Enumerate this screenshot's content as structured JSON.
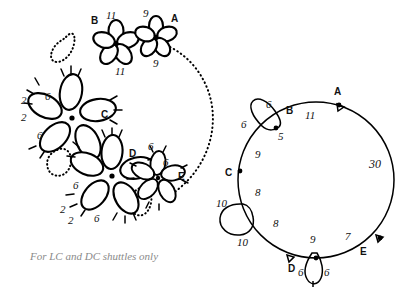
{
  "figure": {
    "caption": "For LC and DC shuttles only",
    "ink_color": "#000000",
    "caption_color": "#8a8a8a",
    "background": "#ffffff"
  },
  "motif_diagram": {
    "title": "",
    "motifs": [
      {
        "id": "A",
        "label": "A",
        "petals": 5,
        "size": "small",
        "counts": [
          "9",
          "9"
        ],
        "count_positions": [
          "top-left",
          "bottom-left"
        ]
      },
      {
        "id": "B",
        "label": "B",
        "petals": 5,
        "size": "small",
        "counts": [
          "11",
          "11"
        ],
        "count_positions": [
          "top-right",
          "bottom-right"
        ]
      },
      {
        "id": "C",
        "label": "C",
        "petals": 5,
        "size": "large",
        "counts": [
          "6",
          "2",
          "2",
          "6"
        ],
        "count_positions": [
          "upper-left",
          "left-upper",
          "left-lower",
          "lower-left"
        ]
      },
      {
        "id": "D",
        "label": "D",
        "petals": 5,
        "size": "large",
        "counts": [
          "6",
          "2",
          "2",
          "6"
        ],
        "count_positions": [
          "left-upper",
          "lower-left-outer",
          "lower-left-inner",
          "bottom"
        ]
      },
      {
        "id": "E",
        "label": "E",
        "petals": 5,
        "size": "small",
        "counts": [
          "6",
          "6"
        ],
        "count_positions": [
          "top",
          "upper-right"
        ]
      }
    ],
    "ghost_loops": 3,
    "dotted_path": "outer dotted arc linking motif A to motif E"
  },
  "circle_diagram": {
    "points": [
      {
        "label": "A",
        "position": "top-right"
      },
      {
        "label": "B",
        "position": "top-left"
      },
      {
        "label": "C",
        "position": "left"
      },
      {
        "label": "D",
        "position": "bottom"
      },
      {
        "label": "E",
        "position": "bottom-right"
      }
    ],
    "segment_counts": [
      "11",
      "5",
      "9",
      "8",
      "8",
      "9",
      "7",
      "30"
    ],
    "rings": [
      {
        "name": "ring-top-left",
        "counts": [
          "6",
          "6"
        ]
      },
      {
        "name": "ring-left",
        "counts": [
          "10",
          "10"
        ]
      },
      {
        "name": "ring-bottom",
        "counts": [
          "6",
          "6"
        ]
      }
    ],
    "large_count": "30"
  }
}
